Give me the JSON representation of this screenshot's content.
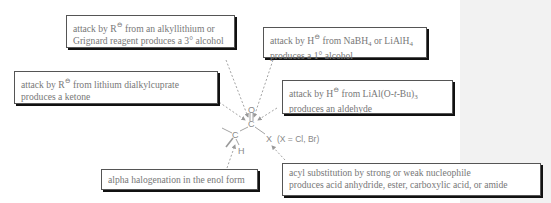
{
  "colors": {
    "text": "#777777",
    "border": "#555555",
    "shadow": "#111111",
    "arrow": "#999999",
    "side_panel": "#f2f2f2"
  },
  "molecule": {
    "atoms": {
      "carbonyl_carbon": "C",
      "oxygen": "O",
      "alpha_carbon": "C",
      "halogen": "X",
      "hydrogen": "H"
    },
    "note": "(X = Cl, Br)"
  },
  "boxes": [
    {
      "id": "alkyllithium",
      "prefix": "attack by R",
      "charge": "⊖",
      "line1_rest": " from an alkyllithium or",
      "line2": "Grignard reagent produces a 3° alcohol"
    },
    {
      "id": "nabh4",
      "prefix": "attack by H",
      "charge": "⊖",
      "line1_mid": " from NaBH",
      "sub1": "4",
      "line1_mid2": " or LiAlH",
      "sub2": "4",
      "line2": "produces a 1° alcohol"
    },
    {
      "id": "cuprate",
      "prefix": "attack by R",
      "charge": "⊖",
      "line1_rest": " from lithium dialkylcuprate",
      "line2": "produces a ketone"
    },
    {
      "id": "lialotbu",
      "prefix": "attack by H",
      "charge": "⊖",
      "line1_mid": " from LiAl(O-",
      "ital": "t",
      "line1_mid2": "-Bu)",
      "sub1": "3",
      "line2": "produces an aldehyde"
    },
    {
      "id": "alpha-halogenation",
      "line1": "alpha halogenation in the enol form"
    },
    {
      "id": "acyl-substitution",
      "line1": "acyl substitution by strong or weak nucleophile",
      "line2": "produces acid anhydride, ester, carboxylic acid, or amide"
    }
  ]
}
